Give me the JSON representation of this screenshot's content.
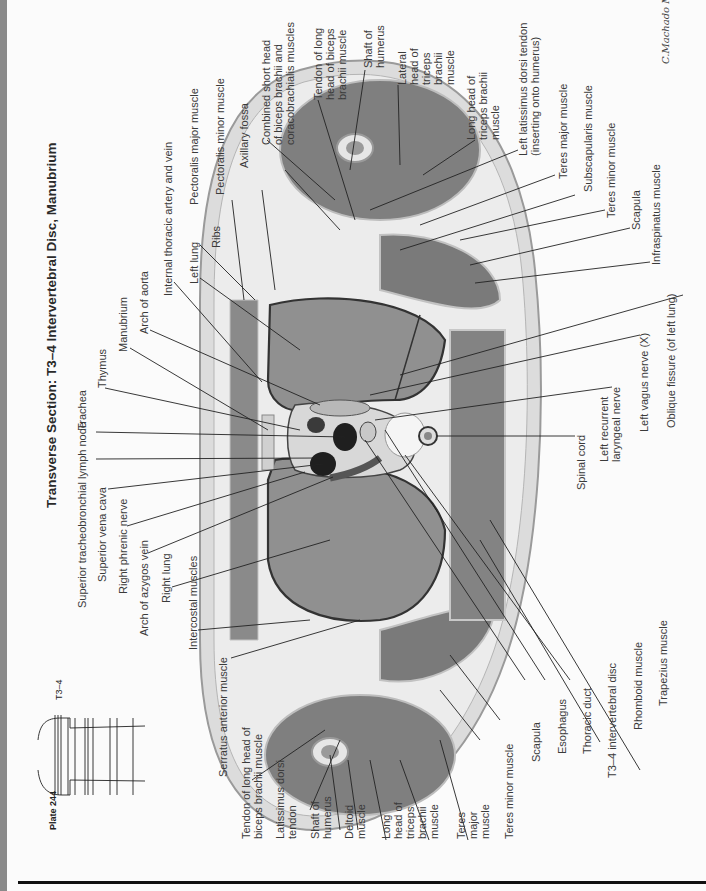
{
  "page": {
    "plate_label": "Plate 244",
    "level_label": "T3–4",
    "title": "Transverse Section: T3–4 Intervertebral Disc, Manubrium",
    "signature": "C.Machado M.D."
  },
  "labels": {
    "top_row": [
      "Superior tracheobronchial lymph node",
      "Trachea",
      "Superior vena cava",
      "Thymus",
      "Right phrenic nerve",
      "Manubrium",
      "Arch of azygos vein",
      "Arch of aorta",
      "Right lung",
      "Internal thoracic artery and vein",
      "Left lung",
      "Ribs",
      "Intercostal muscles",
      "Pectoralis major muscle",
      "Pectoralis minor muscle",
      "Axillary fossa",
      "Serratus anterior muscle"
    ],
    "upper_right": {
      "combined_short_head": "Combined short head\nof biceps brachii and\ncoracobrachialis muscles",
      "tendon_long_head_left": "Tendon of long\nhead of biceps\nbrachii muscle",
      "shaft_humerus_left": "Shaft of\nhumerus",
      "lateral_head_triceps": "Lateral\nhead of\ntriceps\nbrachii\nmuscle",
      "long_head_triceps_left": "Long head of\ntriceps brachii\nmuscle",
      "left_latissimus": "Left latissimus dorsi tendon\n(inserting onto humerus)",
      "teres_major_left": "Teres major muscle",
      "subscapularis": "Subscapularis muscle",
      "teres_minor_left": "Teres minor muscle",
      "scapula_left": "Scapula",
      "infraspinatus": "Infraspinatus muscle",
      "oblique_fissure": "Oblique fissure (of left lung)",
      "left_vagus": "Left vagus nerve (X)",
      "left_recurrent": "Left recurrent\nlaryngeal nerve",
      "spinal_cord": "Spinal cord"
    },
    "bottom_row": {
      "tendon_long_head_right": "Tendon of long head of\nbiceps brachii muscle",
      "latissimus_dorsi_tendon": "Latissimus dorsi\ntendon",
      "shaft_humerus_right": "Shaft of\nhumerus",
      "deltoid": "Deltoid\nmuscle",
      "long_head_triceps_right": "Long\nhead of\ntriceps\nbrachii\nmuscle",
      "teres_major_right": "Teres\nmajor\nmuscle",
      "teres_minor_right": "Teres minor muscle",
      "scapula_right": "Scapula",
      "esophagus": "Esophagus",
      "thoracic_duct": "Thoracic duct",
      "t34_disc": "T3–4 intervertebral disc",
      "rhomboid": "Rhomboid muscle",
      "trapezius": "Trapezius muscle"
    }
  },
  "colors": {
    "strip": "#8a8a8a",
    "skin": "#d9d9d9",
    "fat": "#ececec",
    "muscle": "#7d7d7d",
    "lung": "#8f8f8f",
    "vessel": "#2a2a2a",
    "leader": "#222222"
  }
}
